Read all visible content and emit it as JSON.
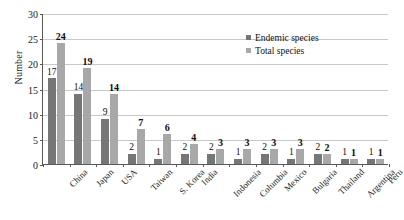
{
  "chart_data": {
    "type": "bar",
    "title": "",
    "xlabel": "",
    "ylabel": "Number",
    "ylim": [
      0,
      30
    ],
    "ytick_step": 5,
    "yticks": [
      0,
      5,
      10,
      15,
      20,
      25,
      30
    ],
    "grid": true,
    "legend_position": "top-right",
    "categories": [
      "China",
      "Japan",
      "USA",
      "Taiwan",
      "S. Korea",
      "India",
      "Indonesia",
      "Columbia",
      "Mexico",
      "Bulgaria",
      "Thailand",
      "Argentina",
      "Peru"
    ],
    "series": [
      {
        "name": "Endemic species",
        "color": "#767676",
        "values": [
          17,
          14,
          9,
          2,
          1,
          2,
          2,
          1,
          2,
          1,
          2,
          1,
          1
        ]
      },
      {
        "name": "Total species",
        "color": "#a8a8a8",
        "values": [
          24,
          19,
          14,
          7,
          6,
          4,
          3,
          3,
          3,
          3,
          2,
          1,
          1
        ]
      }
    ]
  },
  "axis": {
    "y_title": "Number"
  },
  "legend": {
    "items": [
      {
        "label": "Endemic species",
        "color": "#767676"
      },
      {
        "label": "Total species",
        "color": "#a8a8a8"
      }
    ]
  }
}
